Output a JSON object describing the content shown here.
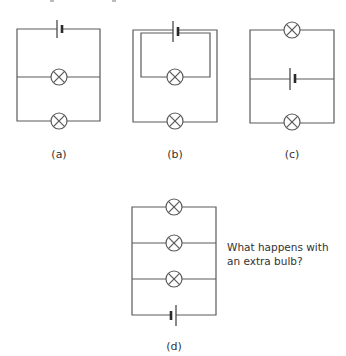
{
  "figure": {
    "circuits": [
      {
        "id": "a",
        "label": "(a)",
        "description": "Battery on top wire; two bulbs in parallel branches"
      },
      {
        "id": "b",
        "label": "(b)",
        "description": "Battery on top; inner loop with one bulb, outer loop with one bulb"
      },
      {
        "id": "c",
        "label": "(c)",
        "description": "Bulb on top, battery in middle branch, bulb on bottom"
      },
      {
        "id": "d",
        "label": "(d)",
        "description": "Three bulbs in parallel branches with battery on bottom wire"
      }
    ],
    "question": {
      "line1": "What happens with",
      "line2": "an extra bulb?"
    },
    "colors": {
      "wire": "#5a5a5a",
      "text": "#333333",
      "background": "#ffffff"
    }
  }
}
